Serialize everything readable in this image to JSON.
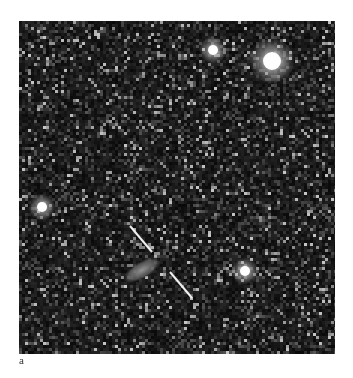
{
  "figure": {
    "panel_label": "a",
    "background_color": "#0a0a0a",
    "stars": [
      {
        "name": "star-top-right-bright",
        "x": 253,
        "y": 40,
        "core_r": 9,
        "halo_r": 22,
        "brightness": 1.0
      },
      {
        "name": "star-top-small",
        "x": 194,
        "y": 29,
        "core_r": 5,
        "halo_r": 13,
        "brightness": 0.85
      },
      {
        "name": "star-left",
        "x": 23,
        "y": 186,
        "core_r": 5,
        "halo_r": 13,
        "brightness": 0.85
      },
      {
        "name": "star-bottom-right",
        "x": 226,
        "y": 250,
        "core_r": 5,
        "halo_r": 13,
        "brightness": 0.9
      }
    ],
    "galaxy": {
      "x": 123,
      "y": 249,
      "rx": 22,
      "ry": 9,
      "rotate_deg": -30,
      "color": "#8a8a8a"
    },
    "slit_line": {
      "segments": [
        {
          "x1": 111,
          "y1": 205,
          "x2": 133,
          "y2": 231
        },
        {
          "x1": 151,
          "y1": 251,
          "x2": 173,
          "y2": 277
        }
      ],
      "color": "#f0f0f0",
      "width": 2
    }
  }
}
